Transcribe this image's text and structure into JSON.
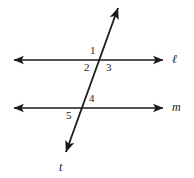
{
  "figure": {
    "background_color": "#ffffff",
    "stroke_color": "#1a1a1a",
    "line_width_px": 1.6,
    "width_px": 194,
    "height_px": 178
  },
  "lines": [
    {
      "id": "line-l",
      "label": "ℓ",
      "kind": "horizontal",
      "label_x": 172,
      "label_y": 53,
      "x1": 14,
      "y1": 60,
      "x2": 163,
      "y2": 60,
      "arrow_start": true,
      "arrow_end": true
    },
    {
      "id": "line-m",
      "label": "m",
      "kind": "horizontal",
      "label_x": 172,
      "label_y": 101,
      "x1": 14,
      "y1": 108,
      "x2": 163,
      "y2": 108,
      "arrow_start": true,
      "arrow_end": true
    },
    {
      "id": "line-t",
      "label": "t",
      "kind": "transversal",
      "label_x": 59,
      "label_y": 161,
      "x1": 118,
      "y1": 8,
      "x2": 66,
      "y2": 152,
      "arrow_start": true,
      "arrow_end": true
    }
  ],
  "intersections": [
    {
      "id": "intersection-l-t",
      "x": 101,
      "y": 60
    },
    {
      "id": "intersection-m-t",
      "x": 84,
      "y": 108
    }
  ],
  "angle_labels": [
    {
      "id": "angle-1",
      "text": "1",
      "x": 90,
      "y": 45,
      "at": "intersection-l-t",
      "position": "above-left"
    },
    {
      "id": "angle-2",
      "text": "2",
      "x": 84,
      "y": 62,
      "at": "intersection-l-t",
      "position": "below-left"
    },
    {
      "id": "angle-3",
      "text": "3",
      "x": 106,
      "y": 62,
      "at": "intersection-l-t",
      "position": "below-right"
    },
    {
      "id": "angle-4",
      "text": "4",
      "x": 89,
      "y": 93,
      "at": "intersection-m-t",
      "position": "above-right"
    },
    {
      "id": "angle-5",
      "text": "5",
      "x": 66,
      "y": 110,
      "at": "intersection-m-t",
      "position": "below-left"
    }
  ]
}
